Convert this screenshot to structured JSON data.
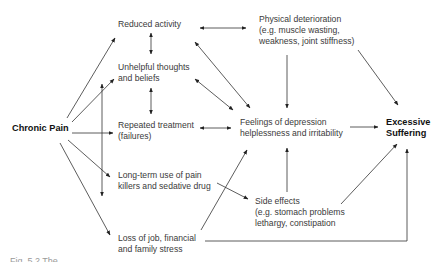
{
  "diagram": {
    "nodes": {
      "chronic_pain": "Chronic Pain",
      "reduced_activity": "Reduced activity",
      "unhelpful_thoughts": "Unhelpful thoughts\nand beliefs",
      "repeated_treatment": "Repeated treatment\n(failures)",
      "long_term_use": "Long-term use of pain\nkillers and sedative drug",
      "loss_of_job": "Loss of job, financial\nand family stress",
      "physical_deterioration": "Physical deterioration\n(e.g. muscle wasting,\nweakness, joint stiffness)",
      "feelings_depression": "Feelings of depression\nhelplessness and irritability",
      "side_effects": "Side effects\n(e.g. stomach problems\nlethargy, constipation",
      "excessive_suffering": "Excessive\nSuffering"
    },
    "edges": [
      {
        "from": "Chronic Pain",
        "to": "Reduced activity"
      },
      {
        "from": "Chronic Pain",
        "to": "Unhelpful thoughts and beliefs"
      },
      {
        "from": "Chronic Pain",
        "to": "Repeated treatment (failures)"
      },
      {
        "from": "Chronic Pain",
        "to": "Long-term use of pain killers and sedative drug"
      },
      {
        "from": "Chronic Pain",
        "to": "Loss of job, financial and family stress"
      },
      {
        "from": "Reduced activity",
        "to": "Unhelpful thoughts and beliefs",
        "bidirectional": true
      },
      {
        "from": "Unhelpful thoughts and beliefs",
        "to": "Repeated treatment (failures)",
        "bidirectional": true
      },
      {
        "from": "Reduced activity",
        "to": "Physical deterioration",
        "bidirectional": true
      },
      {
        "from": "Reduced activity",
        "to": "Feelings of depression",
        "bidirectional": true
      },
      {
        "from": "Unhelpful thoughts and beliefs",
        "to": "Feelings of depression",
        "bidirectional": true
      },
      {
        "from": "Repeated treatment (failures)",
        "to": "Feelings of depression",
        "bidirectional": true
      },
      {
        "from": "Long-term use / vertical bar",
        "to": "Unhelpful thoughts and beliefs / Long-term use",
        "bidirectional": true
      },
      {
        "from": "Physical deterioration",
        "to": "Feelings of depression"
      },
      {
        "from": "Physical deterioration",
        "to": "Excessive Suffering"
      },
      {
        "from": "Feelings of depression",
        "to": "Excessive Suffering"
      },
      {
        "from": "Long-term use of pain killers and sedative drug",
        "to": "Side effects"
      },
      {
        "from": "Loss of job, financial and family stress",
        "to": "Feelings of depression"
      },
      {
        "from": "Side effects",
        "to": "Feelings of depression"
      },
      {
        "from": "Side effects",
        "to": "Excessive Suffering"
      },
      {
        "from": "Loss of job, financial and family stress",
        "to": "Excessive Suffering"
      }
    ]
  },
  "caption": "Fig. 5.2   The ..."
}
